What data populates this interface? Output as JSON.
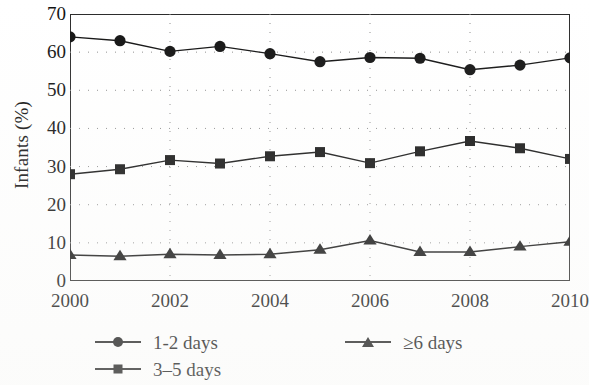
{
  "chart_data": {
    "type": "line",
    "title": "",
    "xlabel": "",
    "ylabel": "Infants (%)",
    "x": [
      2000,
      2001,
      2002,
      2003,
      2004,
      2005,
      2006,
      2007,
      2008,
      2009,
      2010
    ],
    "xtick_labels": [
      "2000",
      "2002",
      "2004",
      "2006",
      "2008",
      "2010"
    ],
    "xtick_values": [
      2000,
      2002,
      2004,
      2006,
      2008,
      2010
    ],
    "ytick_labels": [
      "0",
      "10",
      "20",
      "30",
      "40",
      "50",
      "60",
      "70"
    ],
    "ytick_values": [
      0,
      10,
      20,
      30,
      40,
      50,
      60,
      70
    ],
    "xlim": [
      2000,
      2010
    ],
    "ylim": [
      0,
      70
    ],
    "grid": "horizontal-dotted",
    "legend_position": "below-plot",
    "series": [
      {
        "name": "1-2 days",
        "marker": "circle",
        "color": "#111111",
        "values": [
          64.0,
          63.0,
          60.2,
          61.5,
          59.6,
          57.5,
          58.6,
          58.4,
          55.4,
          56.6,
          58.5
        ]
      },
      {
        "name": "3–5 days",
        "marker": "square",
        "color": "#111111",
        "values": [
          28.0,
          29.3,
          31.7,
          30.8,
          32.7,
          33.8,
          30.9,
          34.0,
          36.7,
          34.8,
          32.0
        ]
      },
      {
        "name": "≥6 days",
        "marker": "triangle",
        "color": "#111111",
        "values": [
          6.8,
          6.5,
          7.0,
          6.8,
          7.0,
          8.2,
          10.6,
          7.6,
          7.6,
          9.0,
          10.3
        ]
      }
    ]
  },
  "legend": {
    "items": [
      {
        "label": "1-2 days",
        "marker": "circle"
      },
      {
        "label": "3–5 days",
        "marker": "square"
      },
      {
        "label": "≥6 days",
        "marker": "triangle"
      }
    ]
  },
  "axes": {
    "y_title": "Infants (%)"
  }
}
